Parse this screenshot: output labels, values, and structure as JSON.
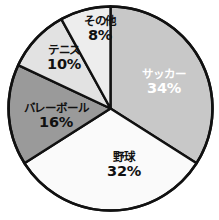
{
  "chart_data": {
    "type": "pie",
    "title": "",
    "subtitle": "",
    "xlabel": "",
    "ylabel": "",
    "grid": false,
    "legend_position": "none",
    "labels_inside_slices": true,
    "start_angle_deg": 0,
    "direction": "clockwise",
    "unit": "%",
    "categories": [
      "サッカー",
      "野球",
      "バレーボール",
      "テニス",
      "その他"
    ],
    "values": [
      34,
      32,
      16,
      10,
      8
    ],
    "total": 100,
    "slices": [
      {
        "label": "サッカー",
        "value": 34,
        "value_text": "34%",
        "color": "#c8c8c8",
        "text_color": "#ffffff",
        "start_deg": 0,
        "end_deg": 122.4,
        "label_x": 164,
        "label_y": 82
      },
      {
        "label": "野球",
        "value": 32,
        "value_text": "32%",
        "color": "#fafafa",
        "text_color": "#111111",
        "start_deg": 122.4,
        "end_deg": 237.6,
        "label_x": 124,
        "label_y": 165
      },
      {
        "label": "バレーボール",
        "value": 16,
        "value_text": "16%",
        "color": "#9a9a9a",
        "text_color": "#111111",
        "start_deg": 237.6,
        "end_deg": 295.2,
        "label_x": 56,
        "label_y": 116
      },
      {
        "label": "テニス",
        "value": 10,
        "value_text": "10%",
        "color": "#e2e2e2",
        "text_color": "#111111",
        "start_deg": 295.2,
        "end_deg": 331.2,
        "label_x": 64,
        "label_y": 58
      },
      {
        "label": "その他",
        "value": 8,
        "value_text": "8%",
        "color": "#ededed",
        "text_color": "#111111",
        "start_deg": 331.2,
        "end_deg": 360,
        "label_x": 100,
        "label_y": 29
      }
    ],
    "geometry": {
      "center_x": 110.5,
      "center_y": 108.5,
      "radius": 102,
      "outline_color": "#111111"
    }
  }
}
